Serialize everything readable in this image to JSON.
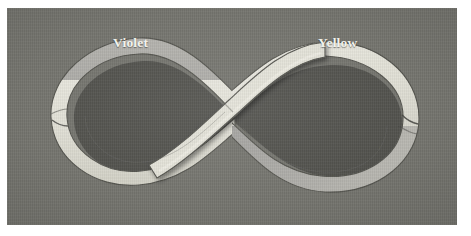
{
  "figure": {
    "kind": "photograph-of-mobius-band",
    "plate_background_color": "#75756f",
    "page_background_color": "#ffffff"
  },
  "labels": {
    "violet": {
      "text": "Violet",
      "color": "#f2f2ec",
      "position": "upper-left, above the left loop"
    },
    "yellow": {
      "text": "Yellow",
      "color": "#f2f2ec",
      "position": "upper-right, above the right loop"
    }
  },
  "strip": {
    "description": "A single flat band looped into a figure eight with a half twist, so one continuous surface shows two differently tinted faces",
    "faces": [
      {
        "name": "pale-face",
        "label_ref": "Yellow",
        "color": "#e6e5dc",
        "shadow_color": "#cfcec4",
        "note": "bright cream/near-white face, reads as the yellow painted side"
      },
      {
        "name": "tinted-face",
        "label_ref": "Violet",
        "color": "#a8a8a4",
        "shadow_color": "#8f8f8c",
        "note": "darker gray-violet face, reads as the violet painted side"
      }
    ],
    "edge_color": "#4a4a46",
    "crossing": {
      "location": "center of the figure eight",
      "over_strand": "pale-face band running from lower-left to upper-right"
    }
  },
  "icons": {
    "mobius": "mobius-strip-icon"
  }
}
